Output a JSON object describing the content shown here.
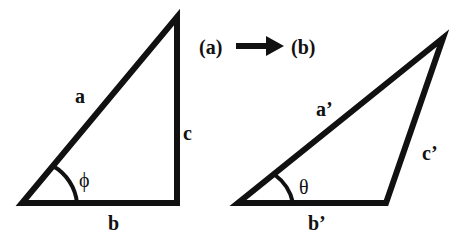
{
  "diagram": {
    "transition": {
      "from": "(a)",
      "to": "(b)",
      "arrow": "right-arrow"
    },
    "triangle_a": {
      "sides": {
        "hypotenuse": "a",
        "base": "b",
        "vertical": "c"
      },
      "angle": "ϕ"
    },
    "triangle_b": {
      "sides": {
        "long": "a’",
        "base": "b’",
        "right": "c’"
      },
      "angle": "θ"
    },
    "colors": {
      "stroke": "#111111",
      "background": "#ffffff"
    }
  }
}
